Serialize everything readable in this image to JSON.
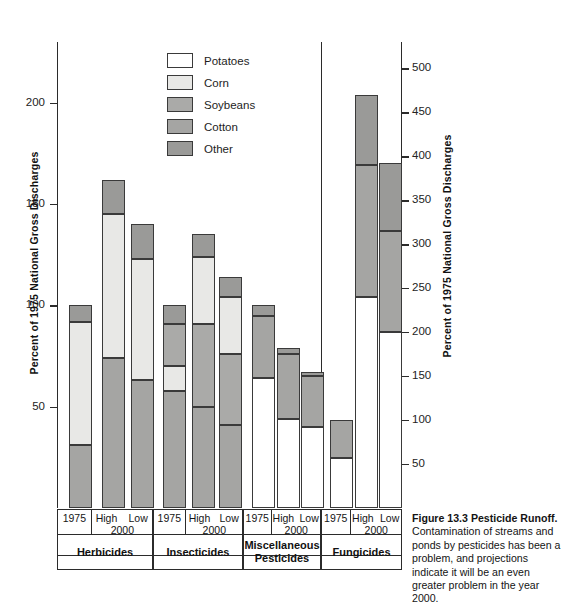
{
  "figure": {
    "caption_title": "Figure 13.3   Pesticide Runoff.",
    "caption_body": "Contamination of streams and ponds by pesticides has been a problem, and projections indicate it will be an even greater problem in the year 2000."
  },
  "legend": {
    "items": [
      {
        "label": "Potatoes",
        "color": "#ffffff"
      },
      {
        "label": "Corn",
        "color": "#e8e8e6"
      },
      {
        "label": "Soybeans",
        "color": "#aaaaa8"
      },
      {
        "label": "Cotton",
        "color": "#a5a5a3"
      },
      {
        "label": "Other",
        "color": "#9a9a98"
      }
    ]
  },
  "axes": {
    "left": {
      "title": "Percent of 1975 National Gross Discharges",
      "ticks": [
        50,
        100,
        150,
        200
      ],
      "min": 0,
      "max": 230
    },
    "right": {
      "title": "Percent of 1975 National Gross Discharges",
      "ticks": [
        50,
        100,
        150,
        200,
        250,
        300,
        350,
        400,
        450,
        500
      ],
      "min": 0,
      "max": 530
    }
  },
  "columns": {
    "year_1975": "1975",
    "high": "High",
    "low": "Low",
    "year_2000": "2000"
  },
  "groups": [
    {
      "name": "Herbicides"
    },
    {
      "name": "Insecticides"
    },
    {
      "name": "Miscellaneous\nPesticides"
    },
    {
      "name": "Fungicides"
    }
  ],
  "chart_data": {
    "type": "bar",
    "title": "Pesticide Runoff",
    "subtitle": "",
    "xlabel": "",
    "ylabel": "Percent of 1975 National Gross Discharges",
    "ylabel_right": "Percent of 1975 National Gross Discharges",
    "ylim": [
      0,
      230
    ],
    "ylim_right": [
      0,
      530
    ],
    "yticks": [
      50,
      100,
      150,
      200
    ],
    "yticks_right": [
      50,
      100,
      150,
      200,
      250,
      300,
      350,
      400,
      450,
      500
    ],
    "grid": false,
    "legend_position": "upper-center",
    "stacked": true,
    "legend_entries": [
      "Potatoes",
      "Corn",
      "Soybeans",
      "Cotton",
      "Other"
    ],
    "groups": [
      "Herbicides",
      "Insecticides",
      "Miscellaneous Pesticides",
      "Fungicides"
    ],
    "scenarios": [
      "1975",
      "High 2000",
      "Low 2000"
    ],
    "note": "Fungicides bars are read on the right-hand axis (0-530); all other groups on the left axis (0-230).",
    "bars": [
      {
        "group": "Herbicides",
        "scenario": "1975",
        "axis": "left",
        "total": 100,
        "segments": [
          {
            "series": "Cotton",
            "value": 31
          },
          {
            "series": "Corn",
            "value": 61
          },
          {
            "series": "Other",
            "value": 8
          }
        ]
      },
      {
        "group": "Herbicides",
        "scenario": "High 2000",
        "axis": "left",
        "total": 162,
        "segments": [
          {
            "series": "Cotton",
            "value": 74
          },
          {
            "series": "Corn",
            "value": 71
          },
          {
            "series": "Other",
            "value": 17
          }
        ]
      },
      {
        "group": "Herbicides",
        "scenario": "Low 2000",
        "axis": "left",
        "total": 140,
        "segments": [
          {
            "series": "Cotton",
            "value": 63
          },
          {
            "series": "Corn",
            "value": 60
          },
          {
            "series": "Other",
            "value": 17
          }
        ]
      },
      {
        "group": "Insecticides",
        "scenario": "1975",
        "axis": "left",
        "total": 100,
        "segments": [
          {
            "series": "Cotton",
            "value": 58
          },
          {
            "series": "Corn",
            "value": 12
          },
          {
            "series": "Soybeans",
            "value": 21
          },
          {
            "series": "Other",
            "value": 9
          }
        ]
      },
      {
        "group": "Insecticides",
        "scenario": "High 2000",
        "axis": "left",
        "total": 135,
        "segments": [
          {
            "series": "Cotton",
            "value": 50
          },
          {
            "series": "Soybeans",
            "value": 41
          },
          {
            "series": "Corn",
            "value": 33
          },
          {
            "series": "Other",
            "value": 11
          }
        ]
      },
      {
        "group": "Insecticides",
        "scenario": "Low 2000",
        "axis": "left",
        "total": 114,
        "segments": [
          {
            "series": "Cotton",
            "value": 41
          },
          {
            "series": "Soybeans",
            "value": 35
          },
          {
            "series": "Corn",
            "value": 28
          },
          {
            "series": "Other",
            "value": 10
          }
        ]
      },
      {
        "group": "Miscellaneous Pesticides",
        "scenario": "1975",
        "axis": "left",
        "total": 100,
        "segments": [
          {
            "series": "Potatoes",
            "value": 64
          },
          {
            "series": "Cotton",
            "value": 31
          },
          {
            "series": "Other",
            "value": 5
          }
        ]
      },
      {
        "group": "Miscellaneous Pesticides",
        "scenario": "High 2000",
        "axis": "left",
        "total": 79,
        "segments": [
          {
            "series": "Potatoes",
            "value": 44
          },
          {
            "series": "Cotton",
            "value": 32
          },
          {
            "series": "Other",
            "value": 3
          }
        ]
      },
      {
        "group": "Miscellaneous Pesticides",
        "scenario": "Low 2000",
        "axis": "left",
        "total": 67,
        "segments": [
          {
            "series": "Potatoes",
            "value": 40
          },
          {
            "series": "Cotton",
            "value": 25
          },
          {
            "series": "Other",
            "value": 2
          }
        ]
      },
      {
        "group": "Fungicides",
        "scenario": "1975",
        "axis": "right",
        "total": 100,
        "segments": [
          {
            "series": "Potatoes",
            "value": 57
          },
          {
            "series": "Cotton",
            "value": 43
          }
        ]
      },
      {
        "group": "Fungicides",
        "scenario": "High 2000",
        "axis": "right",
        "total": 470,
        "segments": [
          {
            "series": "Potatoes",
            "value": 240
          },
          {
            "series": "Cotton",
            "value": 150
          },
          {
            "series": "Other",
            "value": 80
          }
        ]
      },
      {
        "group": "Fungicides",
        "scenario": "Low 2000",
        "axis": "right",
        "total": 392,
        "segments": [
          {
            "series": "Potatoes",
            "value": 200
          },
          {
            "series": "Cotton",
            "value": 115
          },
          {
            "series": "Other",
            "value": 77
          }
        ]
      }
    ]
  }
}
